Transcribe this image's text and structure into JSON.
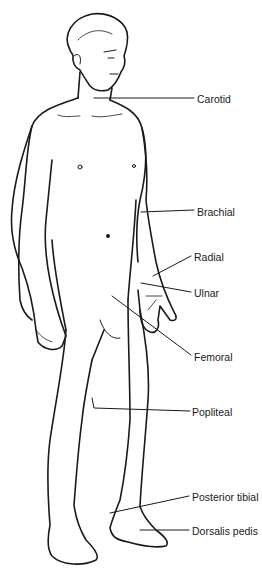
{
  "diagram": {
    "labels": [
      {
        "id": "carotid",
        "text": "Carotid",
        "x": 197,
        "y": 93
      },
      {
        "id": "brachial",
        "text": "Brachial",
        "x": 197,
        "y": 206
      },
      {
        "id": "radial",
        "text": "Radial",
        "x": 194,
        "y": 251
      },
      {
        "id": "ulnar",
        "text": "Ulnar",
        "x": 194,
        "y": 287
      },
      {
        "id": "femoral",
        "text": "Femoral",
        "x": 194,
        "y": 351
      },
      {
        "id": "popliteal",
        "text": "Popliteal",
        "x": 192,
        "y": 406
      },
      {
        "id": "posterior-tibial",
        "text": "Posterior tibial",
        "x": 192,
        "y": 491
      },
      {
        "id": "dorsalis-pedis",
        "text": "Dorsalis pedis",
        "x": 192,
        "y": 525
      }
    ],
    "colors": {
      "line": "#1a1a1a",
      "background": "#ffffff"
    }
  }
}
